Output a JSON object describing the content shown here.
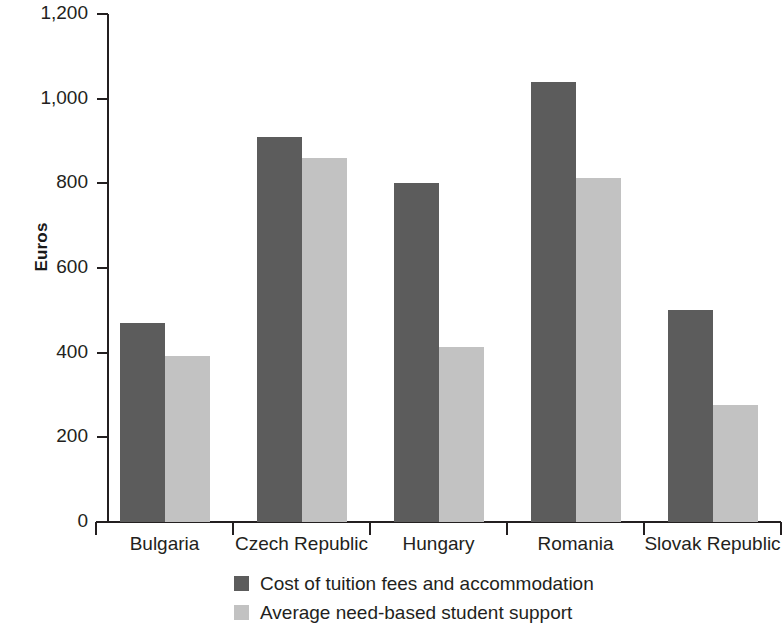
{
  "chart_data": {
    "type": "bar",
    "title": "",
    "xlabel": "",
    "ylabel": "Euros",
    "ylim": [
      0,
      1200
    ],
    "yticks": [
      0,
      200,
      400,
      600,
      800,
      1000,
      1200
    ],
    "ytick_labels": [
      "0",
      "200",
      "400",
      "600",
      "800",
      "1,000",
      "1,200"
    ],
    "grid": false,
    "legend_position": "bottom",
    "categories": [
      "Bulgaria",
      "Czech Republic",
      "Hungary",
      "Romania",
      "Slovak Republic"
    ],
    "series": [
      {
        "name": "Cost of tuition fees and accommodation",
        "color": "#5c5c5c",
        "values": [
          470,
          910,
          800,
          1040,
          500
        ]
      },
      {
        "name": "Average need-based student support",
        "color": "#c2c2c2",
        "values": [
          393,
          860,
          413,
          812,
          277
        ]
      }
    ]
  },
  "legend": {
    "items": [
      {
        "label": "Cost of tuition fees and accommodation",
        "swatch": "dark"
      },
      {
        "label": "Average need-based student support",
        "swatch": "light"
      }
    ]
  },
  "colors": {
    "dark_bar": "#5c5c5c",
    "light_bar": "#c2c2c2",
    "axis": "#231f20",
    "background": "#ffffff"
  }
}
